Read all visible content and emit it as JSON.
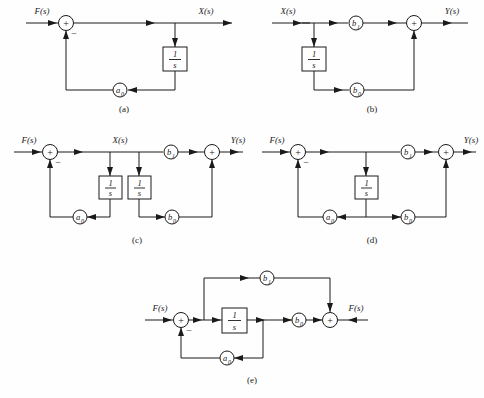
{
  "figure": {
    "background_color": "#fefefe",
    "line_color": "#1a1a1a",
    "integrator_numerator": "1",
    "integrator_denominator": "s"
  },
  "diagrams": [
    {
      "id": "a",
      "caption": "(a)",
      "input_label": "F(s)",
      "output_label": "X(s)",
      "summer_plus": "+",
      "summer_minus": "−",
      "blocks": [
        {
          "name": "integrator",
          "numerator": "1",
          "denominator": "s"
        }
      ],
      "gains": [
        {
          "name": "feedback-gain",
          "label": "a",
          "subscript": "0"
        }
      ]
    },
    {
      "id": "b",
      "caption": "(b)",
      "input_label": "X(s)",
      "output_label": "Y(s)",
      "summer_plus": "+",
      "summer_minus": "",
      "blocks": [
        {
          "name": "integrator",
          "numerator": "1",
          "denominator": "s"
        }
      ],
      "gains": [
        {
          "name": "feedforward-gain-b1",
          "label": "b",
          "subscript": "1"
        },
        {
          "name": "feedforward-gain-b0",
          "label": "b",
          "subscript": "0"
        }
      ]
    },
    {
      "id": "c",
      "caption": "(c)",
      "input_label": "F(s)",
      "node_label": "X(s)",
      "output_label": "Y(s)",
      "summer_plus": "+",
      "summer_minus": "−",
      "blocks": [
        {
          "name": "integrator-left",
          "numerator": "1",
          "denominator": "s"
        },
        {
          "name": "integrator-right",
          "numerator": "1",
          "denominator": "s"
        }
      ],
      "gains": [
        {
          "name": "feedback-gain-a0",
          "label": "a",
          "subscript": "0"
        },
        {
          "name": "feedforward-gain-b1",
          "label": "b",
          "subscript": "1"
        },
        {
          "name": "feedforward-gain-b0",
          "label": "b",
          "subscript": "0"
        }
      ]
    },
    {
      "id": "d",
      "caption": "(d)",
      "input_label": "F(s)",
      "output_label": "Y(s)",
      "summer_plus": "+",
      "summer_minus": "−",
      "blocks": [
        {
          "name": "integrator",
          "numerator": "1",
          "denominator": "s"
        }
      ],
      "gains": [
        {
          "name": "feedback-gain-a0",
          "label": "a",
          "subscript": "0"
        },
        {
          "name": "feedforward-gain-b1",
          "label": "b",
          "subscript": "1"
        },
        {
          "name": "feedforward-gain-b0",
          "label": "b",
          "subscript": "0"
        }
      ]
    },
    {
      "id": "e",
      "caption": "(e)",
      "input_label": "F(s)",
      "output_label": "F(s)",
      "summer_plus": "+",
      "summer_minus": "−",
      "blocks": [
        {
          "name": "integrator",
          "numerator": "1",
          "denominator": "s"
        }
      ],
      "gains": [
        {
          "name": "feedback-gain-a0",
          "label": "a",
          "subscript": "0"
        },
        {
          "name": "bypass-gain-b1",
          "label": "b",
          "subscript": "1"
        },
        {
          "name": "feedforward-gain-b0",
          "label": "b",
          "subscript": "0"
        }
      ]
    }
  ]
}
